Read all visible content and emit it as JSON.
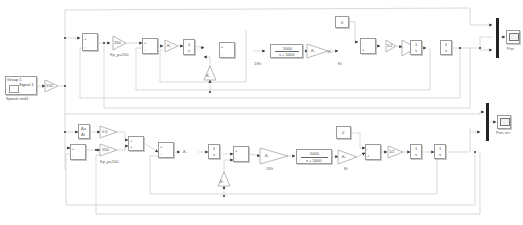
{
  "diagram": {
    "type": "simulink-block-diagram",
    "source_block": {
      "group": "Group 1",
      "signal": "Signal 1",
      "label": "Speed cmd1"
    },
    "input_gain": {
      "value": "150"
    },
    "top_loop": {
      "sum1": {
        "signs": [
          "+",
          "-"
        ]
      },
      "gain_kp": {
        "value": "150",
        "label": "Kp_p=150"
      },
      "sum2": {
        "signs": [
          "+",
          "-"
        ]
      },
      "gain_k1": {
        "value": "-K-"
      },
      "block_frac": {
        "num": "1",
        "den": "s"
      },
      "sum3": {
        "signs": [
          "+",
          "-"
        ]
      },
      "feedback_gain": {
        "value": "-K-"
      },
      "gain_inv_kt": {
        "value": "-K-",
        "label": "1/Kt"
      },
      "tf": {
        "num": "5000",
        "den": "s + 5000"
      },
      "gain_kt": {
        "value": "-K-",
        "label": "Kt"
      },
      "constant": {
        "value": "0"
      },
      "sum4": {
        "signs": [
          "-",
          "+"
        ]
      },
      "gain_inv_j": {
        "value": "1/J"
      },
      "int1": {
        "num": "1",
        "den": "s"
      },
      "int2": {
        "num": "1",
        "den": "s"
      },
      "scope": {
        "label": "Pos"
      }
    },
    "bottom_loop": {
      "derivative": {
        "num": "Δu",
        "den": "Δt"
      },
      "gain_ff": {
        "value": "0.5"
      },
      "sum1": {
        "signs": [
          "+",
          "-"
        ]
      },
      "gain_kp": {
        "value": "150",
        "label": "Kp_p=150"
      },
      "sum_ff": {
        "signs": [
          "+",
          "+"
        ]
      },
      "sum2": {
        "signs": [
          "+",
          "-"
        ]
      },
      "gain_k1": {
        "value": "-K-"
      },
      "block_frac": {
        "num": "1",
        "den": "s"
      },
      "sum3": {
        "signs": [
          "+",
          "-"
        ]
      },
      "feedback_gain": {
        "value": "-K-"
      },
      "gain_inv_kt": {
        "value": "-K-",
        "label": "1/Kt"
      },
      "tf": {
        "num": "5000",
        "den": "s + 5000"
      },
      "gain_kt": {
        "value": "-K-",
        "label": "Kt"
      },
      "constant": {
        "value": "0"
      },
      "sum4": {
        "signs": [
          "-",
          "+"
        ]
      },
      "gain_inv_j": {
        "value": "1/J"
      },
      "int1": {
        "num": "1",
        "den": "s"
      },
      "int2": {
        "num": "1",
        "den": "s"
      },
      "scope": {
        "label": "Pos. err"
      }
    },
    "colors": {
      "line": "#cfcfcf",
      "block_border": "#9a9a9a",
      "mux": "#222222",
      "arrow": "#333333"
    }
  }
}
